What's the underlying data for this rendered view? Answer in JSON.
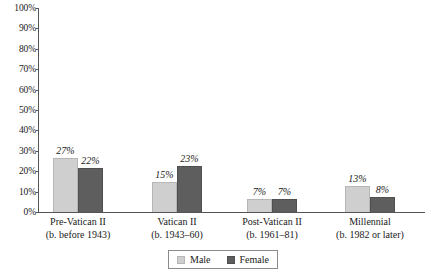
{
  "chart_data": {
    "type": "bar",
    "title": "",
    "subtitle": "",
    "xlabel": "",
    "ylabel": "",
    "ylim": [
      0,
      100
    ],
    "grid": false,
    "legend_position": "bottom",
    "categories": [
      "Pre-Vatican II",
      "Vatican II",
      "Post-Vatican II",
      "Millennial"
    ],
    "category_sublabels": [
      "(b. before 1943)",
      "(b. 1943–60)",
      "(b. 1961–81)",
      "(b. 1982 or later)"
    ],
    "series": [
      {
        "name": "Male",
        "color": "#cfcfcf",
        "values": [
          27,
          15,
          7,
          13
        ],
        "labels": [
          "27%",
          "15%",
          "7%",
          "13%"
        ]
      },
      {
        "name": "Female",
        "color": "#5e5e5e",
        "values": [
          22,
          23,
          7,
          8
        ],
        "labels": [
          "22%",
          "23%",
          "7%",
          "8%"
        ]
      }
    ],
    "y_ticks": [
      0,
      10,
      20,
      30,
      40,
      50,
      60,
      70,
      80,
      90,
      100
    ],
    "y_tick_labels": [
      "0%",
      "10%",
      "20%",
      "30%",
      "40%",
      "50%",
      "60%",
      "70%",
      "80%",
      "90%",
      "100%"
    ]
  },
  "legend": {
    "items": [
      {
        "label": "Male",
        "swatch": "male"
      },
      {
        "label": "Female",
        "swatch": "female"
      }
    ]
  }
}
